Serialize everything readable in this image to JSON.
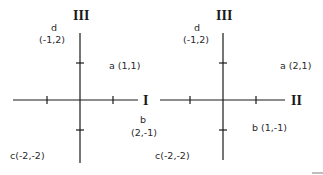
{
  "colors": {
    "ink": "#1a1a1a",
    "background": "#ffffff"
  },
  "diagrams": [
    {
      "vertical_axis_label": "III",
      "horizontal_axis_label": "I",
      "points": {
        "a": {
          "name": "a",
          "coords": "(1,1)",
          "text": "a (1,1)"
        },
        "b": {
          "name": "b",
          "coords": "(2,-1)"
        },
        "c": {
          "name": "c",
          "coords": "(-2,-2)",
          "text": "c(-2,-2)"
        },
        "d": {
          "name": "d",
          "coords": "(-1,2)"
        }
      }
    },
    {
      "vertical_axis_label": "III",
      "horizontal_axis_label": "II",
      "points": {
        "a": {
          "name": "a",
          "coords": "(2,1)",
          "text": "a (2,1)"
        },
        "b": {
          "name": "b",
          "coords": "(1,-1)",
          "text": "b (1,-1)"
        },
        "c": {
          "name": "c",
          "coords": "(-2,-2)",
          "text": "c(-2,-2)"
        },
        "d": {
          "name": "d",
          "coords": "(-1,2)"
        }
      }
    }
  ]
}
